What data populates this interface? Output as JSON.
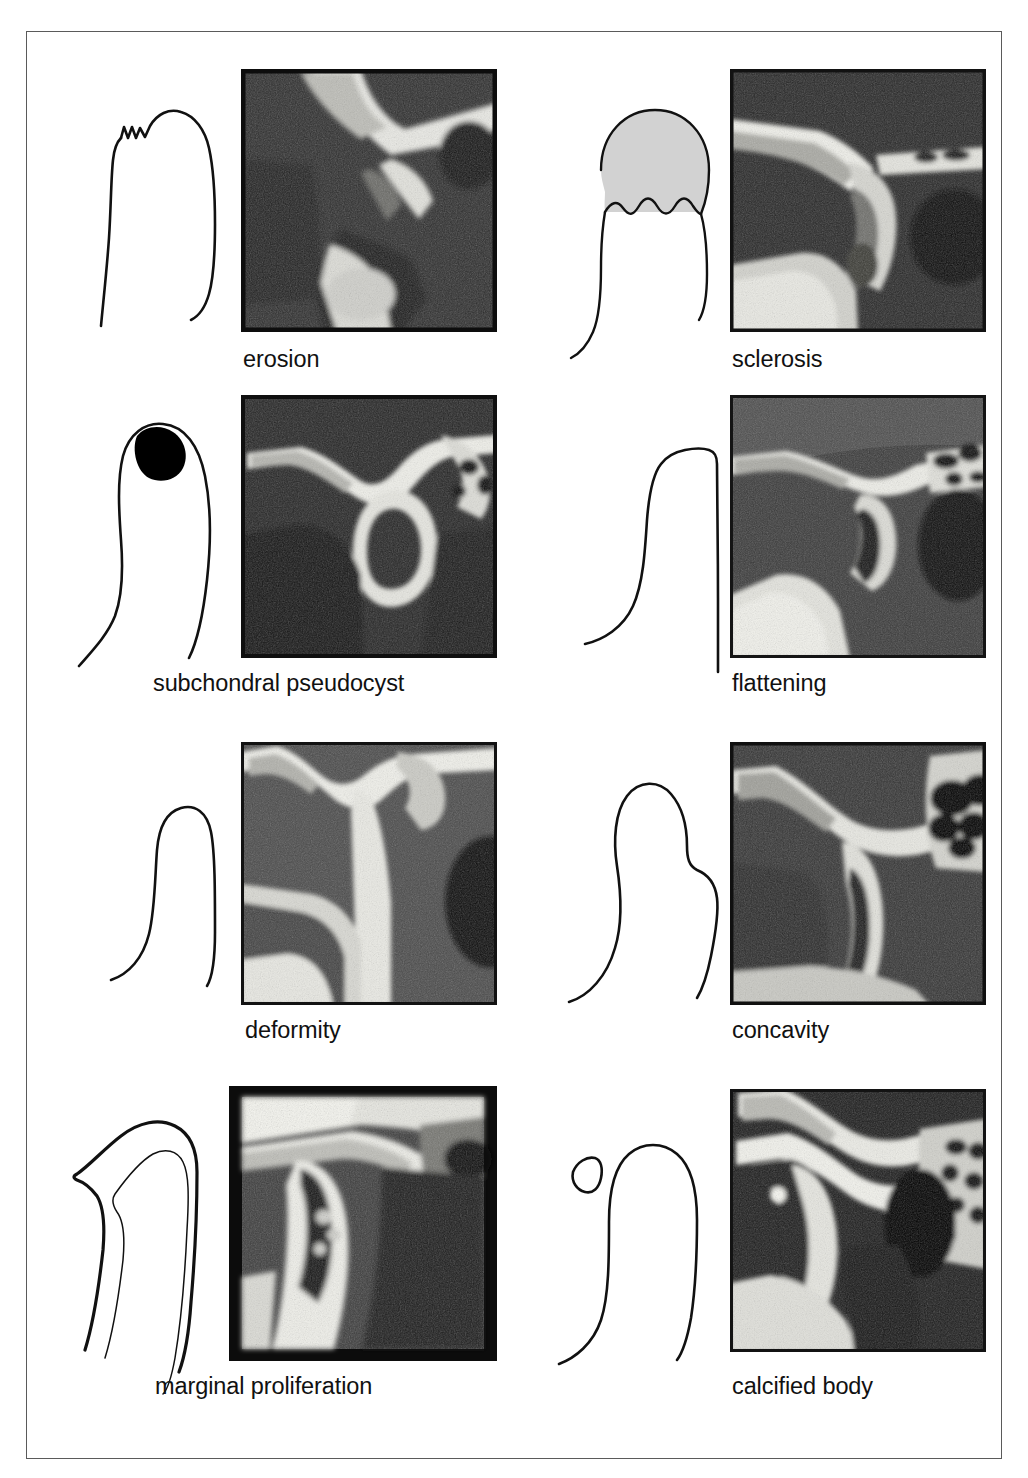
{
  "figure": {
    "kind": "medical-illustration-grid",
    "columns": 2,
    "rows": 4,
    "frame_border_color": "#5a5a5a",
    "background_color": "#ffffff",
    "schematic_line_color": "#111111",
    "sclerosis_fill_color": "#d2d2d2",
    "pseudocyst_fill_color": "#000000"
  },
  "panels": [
    {
      "id": "erosion",
      "caption": "erosion",
      "schematic_name": "condyle-outline-erosion",
      "xray_name": "radiograph-erosion",
      "description": "condyle outline with small irregular notches along the superior surface"
    },
    {
      "id": "sclerosis",
      "caption": "sclerosis",
      "schematic_name": "condyle-outline-sclerosis",
      "xray_name": "radiograph-sclerosis",
      "description": "condyle outline with grey-shaded dome capped by a scalloped inner border"
    },
    {
      "id": "pseudocyst",
      "caption": "subchondral pseudocyst",
      "schematic_name": "condyle-outline-subchondral-pseudocyst",
      "xray_name": "radiograph-subchondral-pseudocyst",
      "description": "condyle outline with a solid black rounded cavity beneath the articular surface"
    },
    {
      "id": "flattening",
      "caption": "flattening",
      "schematic_name": "condyle-outline-flattening",
      "xray_name": "radiograph-flattening",
      "description": "condyle outline with a straightened, flat superior surface"
    },
    {
      "id": "deformity",
      "caption": "deformity",
      "schematic_name": "condyle-outline-deformity",
      "xray_name": "radiograph-deformity",
      "description": "narrow, tall condyle outline with altered overall shape"
    },
    {
      "id": "concavity",
      "caption": "concavity",
      "schematic_name": "condyle-outline-concavity",
      "xray_name": "radiograph-concavity",
      "description": "condyle outline with a pronounced posterior concave depression"
    },
    {
      "id": "marginal",
      "caption": "marginal proliferation",
      "schematic_name": "condyle-outline-marginal-proliferation",
      "xray_name": "radiograph-marginal-proliferation",
      "description": "condyle outline with an additional bony lip extending beyond the original contour"
    },
    {
      "id": "calcified",
      "caption": "calcified body",
      "schematic_name": "condyle-outline-calcified-body",
      "xray_name": "radiograph-calcified-body",
      "description": "condyle outline with a separate small triangular calcified fragment anterior to it"
    }
  ]
}
